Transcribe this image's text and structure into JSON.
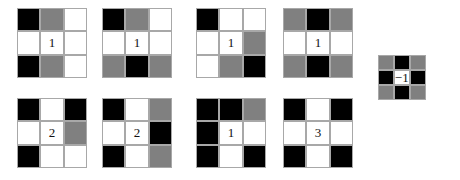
{
  "figure": {
    "colors": {
      "white": "#ffffff",
      "gray": "#808080",
      "black": "#000000",
      "border": "#a8a8a8",
      "background": "#ffffff",
      "text": "#111111"
    },
    "grid_count": 9,
    "grids": [
      {
        "id": "grid-1",
        "label": "1",
        "label_cell": 4,
        "cells": [
          "black",
          "gray",
          "white",
          "white",
          "white",
          "white",
          "black",
          "gray",
          "white"
        ]
      },
      {
        "id": "grid-2",
        "label": "1",
        "label_cell": 4,
        "cells": [
          "black",
          "gray",
          "white",
          "white",
          "white",
          "white",
          "gray",
          "black",
          "gray"
        ]
      },
      {
        "id": "grid-3",
        "label": "1",
        "label_cell": 4,
        "cells": [
          "black",
          "white",
          "white",
          "white",
          "white",
          "gray",
          "white",
          "gray",
          "black"
        ]
      },
      {
        "id": "grid-4",
        "label": "1",
        "label_cell": 4,
        "cells": [
          "gray",
          "black",
          "gray",
          "white",
          "white",
          "white",
          "gray",
          "black",
          "gray"
        ]
      },
      {
        "id": "grid-5",
        "label": "−1",
        "label_cell": 4,
        "cells": [
          "gray",
          "black",
          "gray",
          "black",
          "white",
          "black",
          "gray",
          "black",
          "gray"
        ]
      },
      {
        "id": "grid-6",
        "label": "2",
        "label_cell": 4,
        "cells": [
          "black",
          "white",
          "black",
          "white",
          "white",
          "gray",
          "black",
          "white",
          "white"
        ]
      },
      {
        "id": "grid-7",
        "label": "2",
        "label_cell": 4,
        "cells": [
          "black",
          "white",
          "gray",
          "white",
          "white",
          "black",
          "black",
          "white",
          "gray"
        ]
      },
      {
        "id": "grid-8",
        "label": "1",
        "label_cell": 4,
        "cells": [
          "black",
          "black",
          "gray",
          "black",
          "white",
          "white",
          "black",
          "white",
          "black"
        ]
      },
      {
        "id": "grid-9",
        "label": "3",
        "label_cell": 4,
        "cells": [
          "black",
          "white",
          "black",
          "white",
          "white",
          "white",
          "black",
          "white",
          "black"
        ]
      }
    ]
  }
}
